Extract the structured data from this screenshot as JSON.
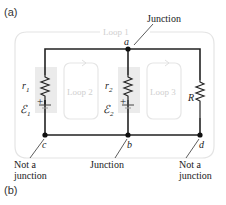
{
  "panels": {
    "a_label": "(a)",
    "b_label": "(b)"
  },
  "loops": {
    "loop1": "Loop 1",
    "loop2": "Loop 2",
    "loop3": "Loop 3"
  },
  "nodes": {
    "a": "a",
    "b": "b",
    "c": "c",
    "d": "d"
  },
  "components": {
    "r1": "r",
    "r1_sub": "1",
    "emf1": "ℰ",
    "emf1_sub": "1",
    "r2": "r",
    "r2_sub": "2",
    "emf2": "ℰ",
    "emf2_sub": "2",
    "R": "R",
    "plus": "+"
  },
  "annotations": {
    "junction_top": "Junction",
    "junction_bottom": "Junction",
    "not_a_junction_left_1": "Not a",
    "not_a_junction_left_2": "junction",
    "not_a_junction_right_1": "Not a",
    "not_a_junction_right_2": "junction"
  },
  "colors": {
    "wire": "#222222",
    "loop_outline": "#e2e2e2",
    "battery_shade": "#e8e8e8",
    "loop_text": "#cfcfcf"
  }
}
